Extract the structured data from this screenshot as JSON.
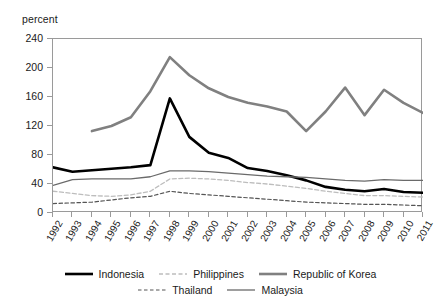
{
  "chart_data": {
    "type": "line",
    "title": "",
    "subtitle": "",
    "xlabel": "",
    "ylabel": "percent",
    "unit_label": "percent",
    "x": [
      1992,
      1993,
      1994,
      1995,
      1996,
      1997,
      1998,
      1999,
      2000,
      2001,
      2002,
      2003,
      2004,
      2005,
      2006,
      2007,
      2008,
      2009,
      2010,
      2011
    ],
    "xtick_labels": [
      "1992",
      "1993",
      "1994",
      "1995",
      "1996",
      "1997",
      "1998",
      "1999",
      "2000",
      "2001",
      "2002",
      "2003",
      "2004",
      "2005",
      "2006",
      "2007",
      "2008",
      "2009",
      "2010",
      "2011"
    ],
    "ytick_labels": [
      "0",
      "40",
      "80",
      "120",
      "160",
      "200",
      "240"
    ],
    "yticks": [
      0,
      40,
      80,
      120,
      160,
      200,
      240
    ],
    "ylim": [
      0,
      240
    ],
    "xlim": [
      1992,
      2011
    ],
    "grid": false,
    "legend_position": "bottom",
    "series": [
      {
        "name": "Indonesia",
        "style": "solid-thick-black",
        "color": "#000000",
        "width": 2.6,
        "dash": "none",
        "values": [
          63,
          57,
          59,
          61,
          63,
          66,
          158,
          105,
          83,
          76,
          62,
          58,
          52,
          45,
          36,
          32,
          30,
          33,
          29,
          28
        ]
      },
      {
        "name": "Philippines",
        "style": "dashed-light-gray",
        "color": "#bdbdbd",
        "width": 1.3,
        "dash": "4,2.5",
        "values": [
          30,
          27,
          24,
          23,
          25,
          30,
          47,
          48,
          47,
          45,
          42,
          40,
          37,
          34,
          30,
          27,
          24,
          24,
          23,
          22
        ]
      },
      {
        "name": "Republic of Korea",
        "style": "solid-thick-gray",
        "color": "#808080",
        "width": 2.6,
        "dash": "none",
        "values": [
          null,
          null,
          113,
          120,
          132,
          168,
          215,
          190,
          172,
          160,
          152,
          147,
          140,
          113,
          140,
          173,
          135,
          170,
          152,
          138
        ]
      },
      {
        "name": "Thailand",
        "style": "dashed-dark-gray",
        "color": "#555555",
        "width": 1.2,
        "dash": "3.5,2.5",
        "values": [
          13,
          14,
          15,
          18,
          21,
          23,
          30,
          27,
          25,
          23,
          21,
          19,
          17,
          15,
          14,
          13,
          12,
          12,
          11,
          10
        ]
      },
      {
        "name": "Malaysia",
        "style": "solid-thin-gray",
        "color": "#6a6a6a",
        "width": 1.3,
        "dash": "none",
        "values": [
          38,
          46,
          47,
          47,
          47,
          50,
          58,
          58,
          57,
          55,
          53,
          51,
          50,
          49,
          47,
          45,
          44,
          46,
          45,
          45
        ]
      }
    ],
    "legend_rows": [
      [
        "Indonesia",
        "Philippines",
        "Republic of Korea"
      ],
      [
        "Thailand",
        "Malaysia"
      ]
    ]
  },
  "colors": {
    "axis": "#9a9a9a",
    "text": "#1a1a1a",
    "background": "#ffffff"
  }
}
